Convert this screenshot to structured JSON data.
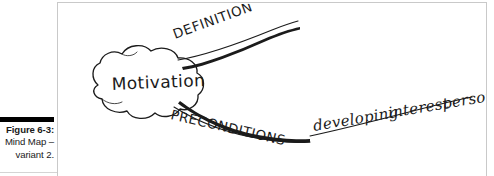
{
  "caption": {
    "figure_label": "Figure 6-3:",
    "line2": "Mind Map –",
    "line3": "variant 2."
  },
  "figure": {
    "title": "Mind Map – variant 2",
    "central_node": "Motivation",
    "branches": [
      {
        "label": "DEFINITION",
        "style": "block-caps",
        "direction": "upper-right"
      },
      {
        "label": "PRECONDITIONS",
        "style": "block-caps",
        "direction": "lower-right"
      }
    ],
    "sub_labels": [
      {
        "label": "developing",
        "style": "cursive"
      },
      {
        "label": "interest",
        "style": "cursive"
      },
      {
        "label": "personal",
        "style": "cursive"
      }
    ],
    "sub_labels_joined": "developing  interest  personal",
    "colors": {
      "ink": "#1b1b1b",
      "paper": "#ffffff",
      "frame_border": "#c9c9c9",
      "caption_rule": "#000000"
    }
  }
}
